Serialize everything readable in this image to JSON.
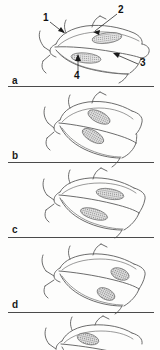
{
  "figure": {
    "type": "scientific-line-drawing-sequence",
    "background_color": "#fdfdfc",
    "line_color": "#5b5b5b",
    "label_color": "#1a1a1a",
    "patch_fill_color": "#8c8c8c",
    "divider_color": "#4a4a4a"
  },
  "panels": [
    {
      "id": "a",
      "label": "a",
      "has_callouts": true,
      "patch_count": 2,
      "divider_below": true
    },
    {
      "id": "b",
      "label": "b",
      "has_callouts": false,
      "patch_count": 2,
      "divider_below": true
    },
    {
      "id": "c",
      "label": "c",
      "has_callouts": false,
      "patch_count": 2,
      "divider_below": true
    },
    {
      "id": "d",
      "label": "d",
      "has_callouts": false,
      "patch_count": 2,
      "divider_below": true
    },
    {
      "id": "e",
      "label": "",
      "has_callouts": false,
      "patch_count": 1,
      "divider_below": false,
      "cropped": true
    }
  ],
  "callouts": [
    {
      "id": "c1",
      "text": "1",
      "x": 44,
      "y": 18,
      "target_x": 68,
      "target_y": 35,
      "arrow": true
    },
    {
      "id": "c2",
      "text": "2",
      "x": 119,
      "y": 10,
      "target_x": 92,
      "target_y": 32,
      "arrow": true
    },
    {
      "id": "c3",
      "text": "3",
      "x": 141,
      "y": 63,
      "target_x": 112,
      "target_y": 53,
      "arrow": true
    },
    {
      "id": "c4",
      "text": "4",
      "x": 76,
      "y": 75,
      "target_x": 78,
      "target_y": 55,
      "arrow": true
    }
  ]
}
